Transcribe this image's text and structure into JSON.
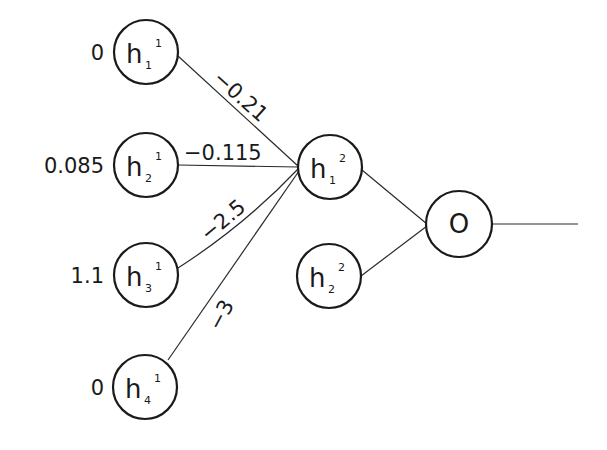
{
  "diagram": {
    "title": "",
    "type": "neural-network",
    "layer1": {
      "nodes": [
        {
          "id": "h_1^1",
          "base": "h",
          "sub": "1",
          "sup": "1",
          "value": "0"
        },
        {
          "id": "h_2^1",
          "base": "h",
          "sub": "2",
          "sup": "1",
          "value": "0.085"
        },
        {
          "id": "h_3^1",
          "base": "h",
          "sub": "3",
          "sup": "1",
          "value": "1.1"
        },
        {
          "id": "h_4^1",
          "base": "h",
          "sub": "4",
          "sup": "1",
          "value": "0"
        }
      ]
    },
    "layer2": {
      "nodes": [
        {
          "id": "h_1^2",
          "base": "h",
          "sub": "1",
          "sup": "2"
        },
        {
          "id": "h_2^2",
          "base": "h",
          "sub": "2",
          "sup": "2"
        }
      ]
    },
    "output": {
      "label": "O"
    },
    "edges": [
      {
        "from": "h_1^1",
        "to": "h_1^2",
        "weight": "−0.21"
      },
      {
        "from": "h_2^1",
        "to": "h_1^2",
        "weight": "−0.115"
      },
      {
        "from": "h_3^1",
        "to": "h_1^2",
        "weight": "−2.5"
      },
      {
        "from": "h_4^1",
        "to": "h_1^2",
        "weight": "−3"
      },
      {
        "from": "h_1^2",
        "to": "O",
        "weight": ""
      },
      {
        "from": "h_2^2",
        "to": "O",
        "weight": ""
      }
    ],
    "colors": {
      "stroke": "#1a1a1a",
      "background": "#ffffff"
    }
  }
}
